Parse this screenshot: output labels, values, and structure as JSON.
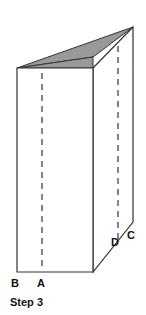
{
  "figure": {
    "title": "Step 3",
    "background_color": "#ffffff",
    "stroke_color": "#333333",
    "shade_color": "#999999",
    "label_color": "#111111",
    "panels": {
      "front_face": {
        "name": "front-panel",
        "fill": "#ffffff",
        "points": "17,68 93,68 93,272 17,272"
      },
      "back_face": {
        "name": "back-panel",
        "fill": "#ffffff",
        "points": "93,68 133,27 133,222 93,272"
      },
      "top_shade": {
        "name": "shaded-top-flap",
        "fill": "#999999",
        "points": "17,68 93,57 93,68"
      },
      "top_shade_wedge": {
        "name": "shaded-top-wedge",
        "fill": "#999999",
        "points": "17,68 133,27 93,57"
      }
    },
    "fold_lines": [
      {
        "name": "fold-line-front",
        "x": 42,
        "y1": 73,
        "y2": 268
      },
      {
        "name": "fold-line-back",
        "x": 118,
        "y1": 46,
        "y2": 240
      }
    ],
    "labels": [
      {
        "id": "B",
        "text": "B",
        "x": 11,
        "y": 287
      },
      {
        "id": "A",
        "text": "A",
        "x": 37,
        "y": 287
      },
      {
        "id": "D",
        "text": "D",
        "x": 111,
        "y": 246
      },
      {
        "id": "C",
        "text": "C",
        "x": 127,
        "y": 239
      }
    ],
    "caption": {
      "text": "Step 3",
      "x": 10,
      "y": 306
    }
  }
}
